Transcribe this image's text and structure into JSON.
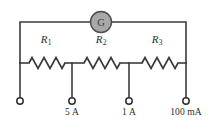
{
  "diagram": {
    "kind": "multi-range-ammeter-shunt-circuit",
    "background_color": "#ffffff",
    "wire_color": "#3b3b3b",
    "meter": {
      "name": "galvanometer",
      "label": "G",
      "fill_color": "#a8a8a8",
      "stroke_color": "#4a4a4a",
      "cx": 101,
      "cy": 22,
      "r": 10.5
    },
    "resistors": [
      {
        "id": "R1",
        "label": "R",
        "subscript": "1",
        "label_x": 46,
        "label_y": 40,
        "x1": 29,
        "x2": 65,
        "y": 63
      },
      {
        "id": "R2",
        "label": "R",
        "subscript": "2",
        "label_x": 101,
        "label_y": 40,
        "x1": 84,
        "x2": 120,
        "y": 63
      },
      {
        "id": "R3",
        "label": "R",
        "subscript": "3",
        "label_x": 157,
        "label_y": 40,
        "x1": 142,
        "x2": 178,
        "y": 63
      }
    ],
    "terminals": [
      {
        "id": "common",
        "label": "",
        "x": 20,
        "y": 101,
        "r": 3.2
      },
      {
        "id": "range-5a",
        "label": "5 A",
        "x": 72,
        "y": 101,
        "r": 3.2,
        "label_x": 72,
        "label_y": 106
      },
      {
        "id": "range-1a",
        "label": "1 A",
        "x": 129,
        "y": 101,
        "r": 3.2,
        "label_x": 129,
        "label_y": 106
      },
      {
        "id": "range-100ma",
        "label": "100 mA",
        "x": 186,
        "y": 101,
        "r": 3.2,
        "label_x": 186,
        "label_y": 106
      }
    ],
    "nodes": {
      "top_y": 22,
      "row_y": 63,
      "left_x": 20,
      "right_x": 186
    }
  }
}
